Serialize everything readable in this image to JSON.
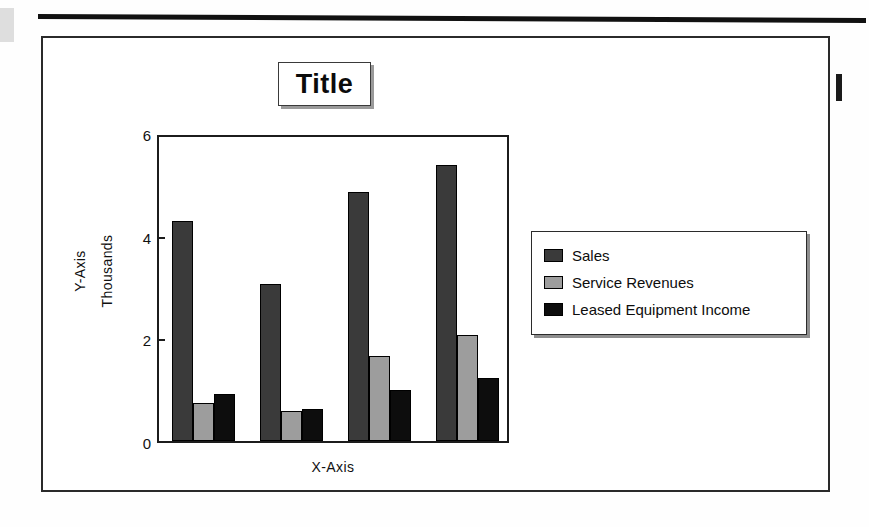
{
  "document": {
    "title_box_label": "Title"
  },
  "chart_data": {
    "type": "bar",
    "title": "Title",
    "xlabel": "X-Axis",
    "ylabel": "Y-Axis",
    "y_units_label": "Thousands",
    "categories": [
      "1",
      "2",
      "3",
      "4"
    ],
    "ylim": [
      0,
      6
    ],
    "yticks": [
      0,
      2,
      4,
      6
    ],
    "ytick_labels": [
      "0",
      "2",
      "4",
      "6"
    ],
    "grid": false,
    "legend_position": "right",
    "series": [
      {
        "name": "Sales",
        "color": "#3a3a3a",
        "values": [
          4.29,
          3.06,
          4.85,
          5.38
        ]
      },
      {
        "name": "Service Revenues",
        "color": "#9d9d9d",
        "values": [
          0.74,
          0.58,
          1.66,
          2.07
        ]
      },
      {
        "name": "Leased Equipment Income",
        "color": "#0d0d0d",
        "values": [
          0.92,
          0.62,
          0.99,
          1.23
        ]
      }
    ]
  },
  "legend": {
    "items": [
      {
        "label": "Sales"
      },
      {
        "label": "Service Revenues"
      },
      {
        "label": "Leased Equipment Income"
      }
    ]
  }
}
